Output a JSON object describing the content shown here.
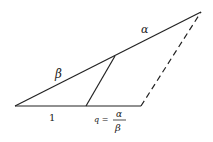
{
  "diagram": {
    "stroke_color": "#222222",
    "background": "#ffffff",
    "labels": {
      "alpha": "α",
      "beta": "β",
      "one": "1",
      "q_lhs": "q =",
      "q_num": "α",
      "q_den": "β"
    },
    "points": {
      "O": [
        15,
        106
      ],
      "A": [
        201,
        12
      ],
      "P": [
        115,
        56
      ],
      "Q": [
        86,
        106
      ],
      "B": [
        141,
        106
      ]
    }
  }
}
